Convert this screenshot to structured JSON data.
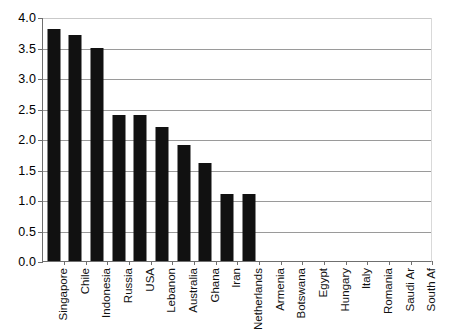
{
  "chart_data": {
    "type": "bar",
    "title": "",
    "subtitle": "",
    "xlabel": "",
    "ylabel": "",
    "ylim": [
      0.0,
      4.0
    ],
    "ytick_labels": [
      "0.0",
      "0.5",
      "1.0",
      "1.5",
      "2.0",
      "2.5",
      "3.0",
      "3.5",
      "4.0"
    ],
    "ytick_values": [
      0.0,
      0.5,
      1.0,
      1.5,
      2.0,
      2.5,
      3.0,
      3.5,
      4.0
    ],
    "grid": true,
    "grid_axis": "y",
    "legend": false,
    "legend_position": "none",
    "bar_color": "#111111",
    "categories": [
      "Singapore",
      "Chile",
      "Indonesia",
      "Russia",
      "USA",
      "Lebanon",
      "Australia",
      "Ghana",
      "Iran",
      "Netherlands",
      "Armenia",
      "Botswana",
      "Egypt",
      "Hungary",
      "Italy",
      "Romania",
      "Saudi Ar",
      "South Af"
    ],
    "values": [
      3.8,
      3.7,
      3.5,
      2.4,
      2.4,
      2.2,
      1.9,
      1.6,
      1.1,
      1.1,
      0,
      0,
      0,
      0,
      0,
      0,
      0,
      0
    ]
  },
  "caption": {
    "partial_text": ""
  }
}
